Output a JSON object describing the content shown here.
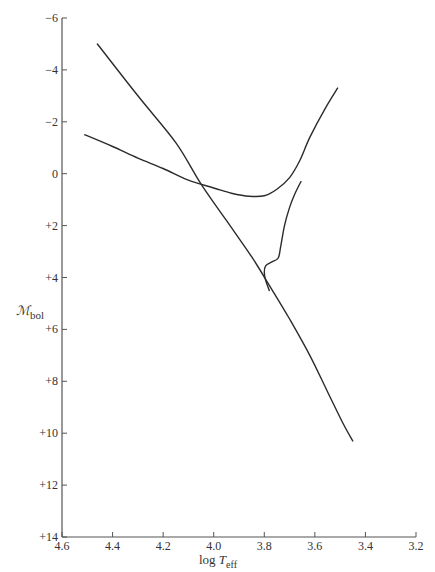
{
  "chart_data": {
    "type": "line",
    "title": "",
    "xlabel": "log T_eff",
    "ylabel": "M_bol",
    "xlim": [
      4.6,
      3.2
    ],
    "ylim": [
      -6,
      14
    ],
    "x_inverted": true,
    "y_inverted": true,
    "grid": false,
    "legend": null,
    "x_ticks": [
      "4.6",
      "4.4",
      "4.2",
      "4.0",
      "3.8",
      "3.6",
      "3.4",
      "3.2"
    ],
    "x_tick_values": [
      4.6,
      4.4,
      4.2,
      4.0,
      3.8,
      3.6,
      3.4,
      3.2
    ],
    "y_ticks": [
      "−6",
      "−4",
      "−2",
      "0",
      "+2",
      "+4",
      "+6",
      "+8",
      "+10",
      "+12",
      "+14"
    ],
    "y_tick_values": [
      -6,
      -4,
      -2,
      0,
      2,
      4,
      6,
      8,
      10,
      12,
      14
    ],
    "series": [
      {
        "name": "zero-age main sequence",
        "points": [
          [
            4.46,
            -5.0
          ],
          [
            4.3,
            -3.0
          ],
          [
            4.15,
            -1.2
          ],
          [
            4.05,
            0.4
          ],
          [
            3.95,
            1.8
          ],
          [
            3.85,
            3.2
          ],
          [
            3.78,
            4.3
          ],
          [
            3.7,
            5.6
          ],
          [
            3.62,
            7.0
          ],
          [
            3.55,
            8.4
          ],
          [
            3.49,
            9.6
          ],
          [
            3.45,
            10.3
          ]
        ]
      },
      {
        "name": "horizontal branch / giant branch",
        "points": [
          [
            4.51,
            -1.5
          ],
          [
            4.4,
            -1.05
          ],
          [
            4.3,
            -0.6
          ],
          [
            4.2,
            -0.2
          ],
          [
            4.1,
            0.25
          ],
          [
            4.0,
            0.55
          ],
          [
            3.93,
            0.75
          ],
          [
            3.86,
            0.87
          ],
          [
            3.8,
            0.85
          ],
          [
            3.75,
            0.6
          ],
          [
            3.7,
            0.15
          ],
          [
            3.66,
            -0.5
          ],
          [
            3.62,
            -1.4
          ],
          [
            3.56,
            -2.5
          ],
          [
            3.51,
            -3.3
          ]
        ]
      },
      {
        "name": "subgiant branch (turnoff to giant branch)",
        "points": [
          [
            3.78,
            4.5
          ],
          [
            3.795,
            4.1
          ],
          [
            3.8,
            3.8
          ],
          [
            3.795,
            3.55
          ],
          [
            3.77,
            3.4
          ],
          [
            3.745,
            3.25
          ],
          [
            3.735,
            2.8
          ],
          [
            3.72,
            2.0
          ],
          [
            3.7,
            1.3
          ],
          [
            3.68,
            0.8
          ],
          [
            3.655,
            0.3
          ]
        ]
      }
    ]
  },
  "axes": {
    "y_label_main": "ℳ",
    "y_label_sub": "bol",
    "x_label_main": "log ",
    "x_label_italic": "T",
    "x_label_sub": "eff"
  }
}
